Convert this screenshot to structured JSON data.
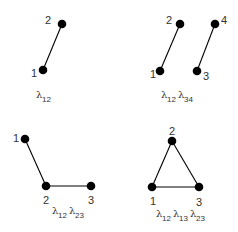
{
  "diagrams": [
    {
      "nodes": [
        {
          "id": "1",
          "x": 43,
          "y": 70,
          "lx": 31,
          "ly": 77
        },
        {
          "id": "2",
          "x": 62,
          "y": 24,
          "lx": 45,
          "ly": 24
        }
      ],
      "edges": [
        [
          "1",
          "2"
        ]
      ],
      "label": {
        "x": 36,
        "y": 100,
        "terms": [
          "12"
        ]
      }
    },
    {
      "nodes": [
        {
          "id": "1",
          "x": 160,
          "y": 71,
          "lx": 150,
          "ly": 78
        },
        {
          "id": "2",
          "x": 180,
          "y": 24,
          "lx": 166,
          "ly": 24
        },
        {
          "id": "3",
          "x": 197,
          "y": 71,
          "lx": 203,
          "ly": 80
        },
        {
          "id": "4",
          "x": 215,
          "y": 24,
          "lx": 221,
          "ly": 24
        }
      ],
      "edges": [
        [
          "1",
          "2"
        ],
        [
          "3",
          "4"
        ]
      ],
      "label": {
        "x": 161,
        "y": 100,
        "terms": [
          "12",
          "34"
        ]
      }
    },
    {
      "nodes": [
        {
          "id": "1",
          "x": 25,
          "y": 139,
          "lx": 13,
          "ly": 142
        },
        {
          "id": "2",
          "x": 46,
          "y": 186,
          "lx": 43,
          "ly": 204
        },
        {
          "id": "3",
          "x": 91,
          "y": 186,
          "lx": 88,
          "ly": 204
        }
      ],
      "edges": [
        [
          "1",
          "2"
        ],
        [
          "2",
          "3"
        ]
      ],
      "label": {
        "x": 52,
        "y": 216,
        "terms": [
          "12",
          "23"
        ]
      }
    },
    {
      "nodes": [
        {
          "id": "1",
          "x": 152,
          "y": 187,
          "lx": 150,
          "ly": 205
        },
        {
          "id": "2",
          "x": 172,
          "y": 141,
          "lx": 169,
          "ly": 135
        },
        {
          "id": "3",
          "x": 199,
          "y": 187,
          "lx": 196,
          "ly": 206
        }
      ],
      "edges": [
        [
          "1",
          "2"
        ],
        [
          "2",
          "3"
        ],
        [
          "1",
          "3"
        ]
      ],
      "label": {
        "x": 156,
        "y": 219,
        "terms": [
          "12",
          "13",
          "23"
        ]
      }
    }
  ],
  "symbol": "λ",
  "colors": {
    "ink": "#000000",
    "text": "#333333",
    "background": "#ffffff"
  }
}
